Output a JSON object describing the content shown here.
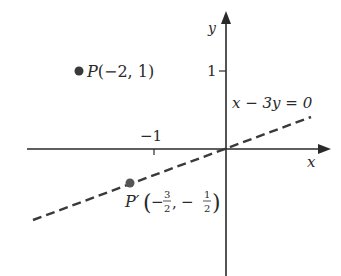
{
  "axes": {
    "x_label": "x",
    "y_label": "y",
    "x_tick": "−1",
    "y_tick": "1"
  },
  "line": {
    "equation": "x − 3y = 0"
  },
  "point_p": {
    "name": "P",
    "coords": "(−2, 1)"
  },
  "point_p_prime": {
    "name": "P′",
    "x_num": "3",
    "x_den": "2",
    "y_num": "1",
    "y_den": "2"
  },
  "colors": {
    "ink": "#2a2a2a",
    "point": "#3a3a3a"
  }
}
